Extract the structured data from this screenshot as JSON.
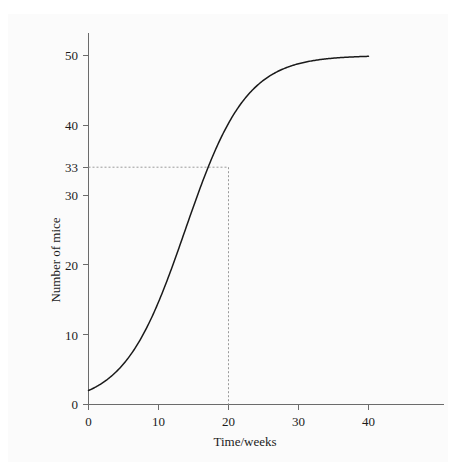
{
  "figure": {
    "background_color": "#fbfbfb",
    "curve_color": "#1a1a1a",
    "axis_color": "#6b6b6b",
    "guide_color": "#9a9a9a",
    "top_artifact_text": ""
  },
  "chart_data": {
    "type": "line",
    "title": "",
    "subtitle": "",
    "xlabel": "Time/weeks",
    "ylabel": "Number of mice",
    "xlim": [
      0,
      45
    ],
    "ylim": [
      0,
      53
    ],
    "grid": false,
    "legend": null,
    "x_ticks": [
      0,
      10,
      20,
      30,
      40
    ],
    "x_tick_labels": [
      "0",
      "10",
      "20",
      "30",
      "40"
    ],
    "y_ticks": [
      0,
      10,
      20,
      30,
      40,
      50
    ],
    "y_tick_labels": [
      "0",
      "10",
      "20",
      "30",
      "40",
      "50"
    ],
    "extra_y_ticks": [
      33
    ],
    "extra_y_tick_labels": [
      "33"
    ],
    "series": [
      {
        "name": "Number of mice",
        "model": "logistic",
        "asymptote": 50,
        "initial_value": 2,
        "x": [
          0,
          2,
          4,
          6,
          8,
          10,
          12,
          14,
          16,
          18,
          20,
          22,
          24,
          26,
          28,
          30,
          32,
          34,
          36,
          38,
          40
        ],
        "y": [
          2.0,
          2.6,
          3.6,
          5.0,
          6.9,
          9.4,
          12.7,
          16.7,
          21.4,
          26.8,
          32.3,
          37.5,
          41.9,
          45.2,
          47.4,
          48.7,
          49.4,
          49.7,
          49.9,
          50.0,
          50.0
        ]
      }
    ],
    "annotations": [
      {
        "type": "guide-lines",
        "x": 20,
        "y": 33,
        "label_x": "20",
        "label_y": "33",
        "style": "dashed",
        "description": "Dashed construction lines from y = 33 across to the curve and down to t = 20 weeks."
      }
    ]
  }
}
